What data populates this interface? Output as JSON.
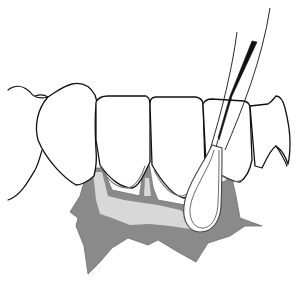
{
  "figure": {
    "elements": [
      {
        "name": "left-gingiva-contour"
      },
      {
        "name": "tooth-canine-left"
      },
      {
        "name": "tooth-incisor-1"
      },
      {
        "name": "tooth-incisor-2"
      },
      {
        "name": "tooth-incisor-3"
      },
      {
        "name": "tooth-incisor-right"
      },
      {
        "name": "gingiva-shaded-region"
      },
      {
        "name": "interdental-instrument"
      }
    ],
    "colors": {
      "outline": "#111111",
      "gum_dark": "#8a8a8a",
      "gum_light": "#d8d8d8",
      "background": "#ffffff"
    }
  }
}
